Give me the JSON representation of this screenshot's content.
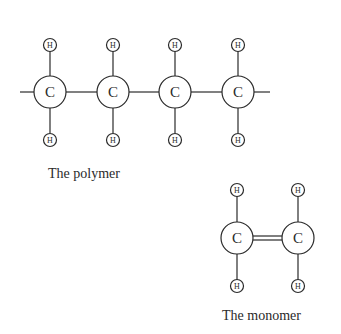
{
  "polymer": {
    "label": "The polymer",
    "carbon_symbol": "C",
    "hydrogen_symbol": "H",
    "carbons": [
      {
        "x": 50,
        "y": 92
      },
      {
        "x": 113,
        "y": 92
      },
      {
        "x": 175,
        "y": 92
      },
      {
        "x": 238,
        "y": 92
      }
    ],
    "bonds": "single"
  },
  "monomer": {
    "label": "The monomer",
    "carbon_symbol": "C",
    "hydrogen_symbol": "H",
    "carbons": [
      {
        "x": 237,
        "y": 238
      },
      {
        "x": 298,
        "y": 238
      }
    ],
    "bonds": "double"
  },
  "colors": {
    "ink": "#2a2a2a",
    "background": "#ffffff"
  }
}
